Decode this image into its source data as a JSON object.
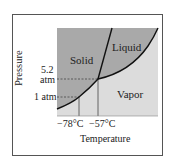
{
  "diagram": {
    "type": "phase-diagram",
    "substance": "CO2",
    "regions": {
      "solid": "Solid",
      "liquid": "Liquid",
      "vapor": "Vapor"
    },
    "axes": {
      "xlabel": "Temperature",
      "ylabel": "Pressure",
      "x_ticks": [
        "−78°C",
        "−57°C"
      ],
      "y_ticks": [
        {
          "line1": "5.2",
          "line2": "atm"
        },
        {
          "line1": "1 atm"
        }
      ]
    },
    "points": {
      "triple_point": {
        "temperature": "−57°C",
        "pressure": "5.2 atm"
      },
      "sublimation_1atm": {
        "temperature": "−78°C",
        "pressure": "1 atm"
      }
    },
    "colors": {
      "solid_liquid_fill": "#a9a9a9",
      "vapor_fill": "#dcdcdc",
      "curve": "#111111",
      "guide": "#444444"
    }
  }
}
